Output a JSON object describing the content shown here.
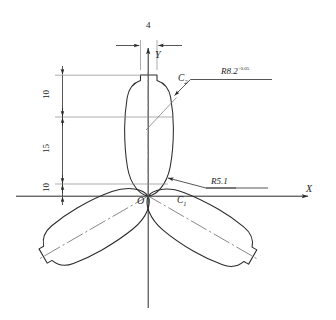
{
  "drawing": {
    "title": "Rotor lobe profile geometry",
    "stroke_color": "#2b2b2b",
    "centerline_color": "#6f6f6f",
    "background": "#ffffff"
  },
  "axes": {
    "x_label": "X",
    "y_label": "Y",
    "origin_label": "O"
  },
  "dimensions": [
    {
      "name": "top-width",
      "value": "4",
      "orientation": "horizontal"
    },
    {
      "name": "upper-height",
      "value": "10",
      "orientation": "vertical"
    },
    {
      "name": "middle-height",
      "value": "15",
      "orientation": "vertical"
    },
    {
      "name": "lower-height",
      "value": "10",
      "orientation": "vertical"
    }
  ],
  "callouts": [
    {
      "name": "upper-radius",
      "prefix": "R",
      "value": "8.2",
      "tolerance": "+0.05"
    },
    {
      "name": "lower-radius",
      "prefix": "R",
      "value": "5.1",
      "tolerance": ""
    }
  ],
  "points": [
    {
      "name": "arc-center-lower",
      "label": "C",
      "subscript": "1"
    },
    {
      "name": "arc-center-upper",
      "label": "C",
      "subscript": "2"
    }
  ]
}
